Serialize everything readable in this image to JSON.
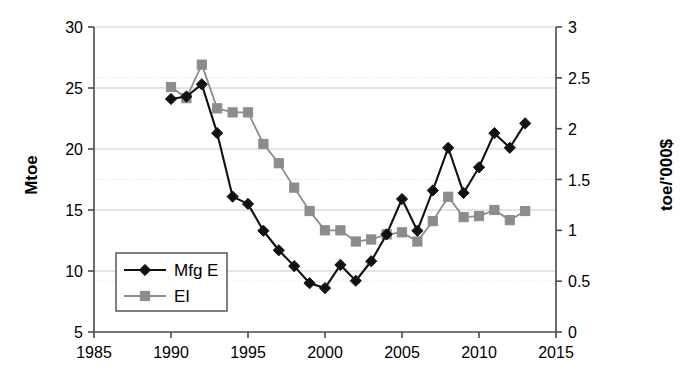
{
  "chart_data": {
    "type": "line",
    "title": "",
    "subtitle": "",
    "xlabel": "",
    "ylabel": "Mtoe",
    "y2label": "toe/'000$",
    "xlim": [
      1985,
      2015
    ],
    "ylim": [
      5,
      30
    ],
    "y2lim": [
      0,
      3
    ],
    "grid": true,
    "legend_position": "inside-lower-left",
    "x_ticks": [
      "1985",
      "1990",
      "1995",
      "2000",
      "2005",
      "2010",
      "2015"
    ],
    "y_ticks": [
      "5",
      "10",
      "15",
      "20",
      "25",
      "30"
    ],
    "y2_ticks": [
      "0",
      "0.5",
      "1",
      "1.5",
      "2",
      "2.5",
      "3"
    ],
    "x": [
      1990,
      1991,
      1992,
      1993,
      1994,
      1995,
      1996,
      1997,
      1998,
      1999,
      2000,
      2001,
      2002,
      2003,
      2004,
      2005,
      2006,
      2007,
      2008,
      2009,
      2010,
      2011,
      2012,
      2013
    ],
    "series": [
      {
        "name": "Mfg E",
        "axis": "left",
        "units": "Mtoe",
        "color": "#111111",
        "marker": "diamond",
        "values": [
          24.1,
          24.3,
          25.3,
          21.3,
          16.1,
          15.5,
          13.3,
          11.7,
          10.4,
          9.0,
          8.6,
          10.5,
          9.2,
          10.8,
          13.0,
          15.9,
          13.3,
          16.6,
          20.1,
          16.4,
          18.5,
          21.3,
          20.1,
          22.1
        ]
      },
      {
        "name": "EI",
        "axis": "right",
        "units": "toe/'000$",
        "color": "#8c8c8c",
        "marker": "square",
        "values_mtoe": [
          25.1,
          24.2,
          26.9,
          23.3,
          23.0,
          23.0,
          20.4,
          18.8,
          16.8,
          14.9,
          13.3,
          13.3,
          12.4,
          12.6,
          13.0,
          13.2,
          12.4,
          14.1,
          16.1,
          14.4,
          14.5,
          15.0,
          14.2,
          14.9
        ],
        "values": [
          2.41,
          2.3,
          2.63,
          2.2,
          2.16,
          2.16,
          1.85,
          1.66,
          1.42,
          1.19,
          1.0,
          1.0,
          0.89,
          0.91,
          0.96,
          0.98,
          0.89,
          1.09,
          1.33,
          1.13,
          1.14,
          1.2,
          1.1,
          1.19
        ]
      }
    ],
    "legend": [
      {
        "label": "Mfg E",
        "color": "#111111",
        "marker": "diamond"
      },
      {
        "label": "EI",
        "color": "#8c8c8c",
        "marker": "square"
      }
    ]
  }
}
